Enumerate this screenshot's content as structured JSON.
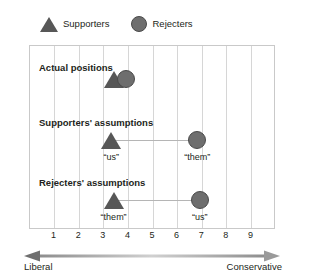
{
  "legend": {
    "items": [
      {
        "icon": "triangle-icon",
        "label": "Supporters",
        "color": "#575757"
      },
      {
        "icon": "circle-icon",
        "label": "Rejecters",
        "color": "#6e6e6e"
      }
    ]
  },
  "axis": {
    "ticks": [
      "1",
      "2",
      "3",
      "4",
      "5",
      "6",
      "7",
      "8",
      "9"
    ],
    "left_label": "Liberal",
    "right_label": "Conservative",
    "arrow_icon": "double-arrow-icon"
  },
  "rows": [
    {
      "label": "Actual positions",
      "points": [
        {
          "shape": "triangle",
          "x": 3.4,
          "label": ""
        },
        {
          "shape": "circle",
          "x": 3.9,
          "label": ""
        }
      ],
      "connector": false
    },
    {
      "label": "Supporters' assumptions",
      "points": [
        {
          "shape": "triangle",
          "x": 3.3,
          "label": "“us”"
        },
        {
          "shape": "circle",
          "x": 6.8,
          "label": "“them”"
        }
      ],
      "connector": true
    },
    {
      "label": "Rejecters' assumptions",
      "points": [
        {
          "shape": "triangle",
          "x": 3.4,
          "label": "“them”"
        },
        {
          "shape": "circle",
          "x": 6.9,
          "label": "“us”"
        }
      ],
      "connector": true
    }
  ],
  "chart_data": {
    "type": "scatter",
    "title": "",
    "xlabel": "Liberal ↔ Conservative",
    "ylabel": "",
    "xlim": [
      0,
      10
    ],
    "xticks": [
      1,
      2,
      3,
      4,
      5,
      6,
      7,
      8,
      9
    ],
    "grid": true,
    "legend": [
      "Supporters",
      "Rejecters"
    ],
    "legend_position": "top-left",
    "categories": [
      "Actual positions",
      "Supporters' assumptions",
      "Rejecters' assumptions"
    ],
    "series": [
      {
        "name": "Supporters",
        "marker": "triangle",
        "values": [
          3.4,
          3.3,
          3.4
        ],
        "point_labels": [
          "",
          "“us”",
          "“them”"
        ]
      },
      {
        "name": "Rejecters",
        "marker": "circle",
        "values": [
          3.9,
          6.8,
          6.9
        ],
        "point_labels": [
          "",
          "“them”",
          "“us”"
        ]
      }
    ],
    "annotations": [
      "Supporters' assumptions connect “us” at 3.3 to “them” at 6.8",
      "Rejecters' assumptions connect “them” at 3.4 to “us” at 6.9"
    ]
  }
}
